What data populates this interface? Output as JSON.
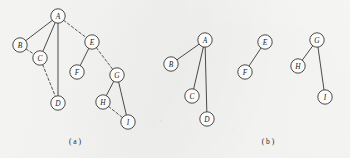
{
  "figure": {
    "background_color": "#f7f7f6",
    "ink_color": "#2c2c2c",
    "width": 350,
    "height": 158,
    "panels": [
      {
        "id": "panel-a",
        "caption": "( a )",
        "caption_pos": {
          "x": 75,
          "y": 141
        },
        "node_radius": 7.2,
        "nodes": [
          {
            "id": "A",
            "label": "A",
            "x": 58,
            "y": 16
          },
          {
            "id": "B",
            "label": "B",
            "x": 20,
            "y": 45
          },
          {
            "id": "C",
            "label": "C",
            "x": 40,
            "y": 58
          },
          {
            "id": "D",
            "label": "D",
            "x": 58,
            "y": 103
          },
          {
            "id": "E",
            "label": "E",
            "x": 92,
            "y": 42
          },
          {
            "id": "F",
            "label": "F",
            "x": 77,
            "y": 72
          },
          {
            "id": "G",
            "label": "G",
            "x": 117,
            "y": 75
          },
          {
            "id": "H",
            "label": "H",
            "x": 103,
            "y": 102
          },
          {
            "id": "I",
            "label": "I",
            "x": 128,
            "y": 122
          }
        ],
        "edges": [
          {
            "from": "A",
            "to": "B",
            "style": "solid"
          },
          {
            "from": "A",
            "to": "C",
            "style": "solid"
          },
          {
            "from": "A",
            "to": "D",
            "style": "solid"
          },
          {
            "from": "A",
            "to": "E",
            "style": "dashed"
          },
          {
            "from": "B",
            "to": "C",
            "style": "dashed"
          },
          {
            "from": "C",
            "to": "D",
            "style": "dashed"
          },
          {
            "from": "E",
            "to": "F",
            "style": "solid"
          },
          {
            "from": "E",
            "to": "G",
            "style": "dashed"
          },
          {
            "from": "G",
            "to": "H",
            "style": "solid"
          },
          {
            "from": "G",
            "to": "I",
            "style": "solid"
          },
          {
            "from": "H",
            "to": "I",
            "style": "dashed"
          }
        ]
      },
      {
        "id": "panel-b",
        "caption": "( b )",
        "caption_pos": {
          "x": 268,
          "y": 141
        },
        "node_radius": 7.2,
        "nodes": [
          {
            "id": "A",
            "label": "A",
            "x": 205,
            "y": 40
          },
          {
            "id": "B",
            "label": "B",
            "x": 171,
            "y": 64
          },
          {
            "id": "C",
            "label": "C",
            "x": 192,
            "y": 96
          },
          {
            "id": "D",
            "label": "D",
            "x": 207,
            "y": 119
          },
          {
            "id": "E",
            "label": "E",
            "x": 265,
            "y": 42
          },
          {
            "id": "F",
            "label": "F",
            "x": 245,
            "y": 72
          },
          {
            "id": "G",
            "label": "G",
            "x": 317,
            "y": 40
          },
          {
            "id": "H",
            "label": "H",
            "x": 298,
            "y": 66
          },
          {
            "id": "I",
            "label": "I",
            "x": 325,
            "y": 97
          }
        ],
        "edges": [
          {
            "from": "A",
            "to": "B",
            "style": "solid"
          },
          {
            "from": "A",
            "to": "C",
            "style": "solid"
          },
          {
            "from": "A",
            "to": "D",
            "style": "solid"
          },
          {
            "from": "E",
            "to": "F",
            "style": "solid"
          },
          {
            "from": "G",
            "to": "H",
            "style": "solid"
          },
          {
            "from": "G",
            "to": "I",
            "style": "solid"
          }
        ]
      }
    ]
  }
}
